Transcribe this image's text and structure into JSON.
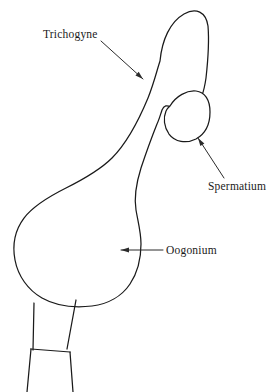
{
  "figure": {
    "type": "biological-line-diagram",
    "background_color": "#ffffff",
    "line_color": "#1a1a1a",
    "label_color": "#1a1a1a"
  },
  "labels": [
    {
      "id": "trichogyne",
      "text": "Trichogyne",
      "text_x": 43,
      "text_y": 38,
      "leader_start_x": 101,
      "leader_start_y": 41,
      "leader_end_x": 143,
      "leader_end_y": 79,
      "arrow_angle_deg": 42
    },
    {
      "id": "spermatium",
      "text": "Spermatium",
      "text_x": 208,
      "text_y": 190,
      "leader_start_x": 224,
      "leader_start_y": 178,
      "leader_end_x": 198,
      "leader_end_y": 138,
      "arrow_angle_deg": 237
    },
    {
      "id": "oogonium",
      "text": "Oogonium",
      "text_x": 166,
      "text_y": 254,
      "leader_start_x": 163,
      "leader_start_y": 250,
      "leader_end_x": 121,
      "leader_end_y": 250,
      "arrow_angle_deg": 180
    }
  ],
  "shapes": {
    "main_body": "M 160,61 C 162,40 170,22 184,14 C 196,7 206,12 208,26 C 209,38 208,60 206,78 C 204,92 201,101 196,105 C 189,110 178,110 171,107 C 167,105 164,105 162,110 C 160,116 159,120 157,124 C 153,134 147,150 141,168 C 136,184 134,198 136,210 C 138,222 141,232 141,244 C 141,258 138,272 130,284 C 122,296 108,304 92,306 C 74,308 56,306 42,298 C 28,290 18,276 15,260 C 12,244 15,230 24,218 C 34,205 50,196 66,188 C 84,179 100,170 112,158 C 126,144 138,122 148,98 C 154,83 157,70 160,61 Z",
    "spermatium_circle": "M 170,106 C 176,96 187,90 196,91 C 205,92 210,100 210,112 C 210,124 205,134 196,139 C 186,144 175,142 169,134 C 164,127 163,118 166,111 C 167,108 169,107 170,106 Z",
    "stalk_upper": "M 34,303 L 33,350 M 76,300 L 67,349",
    "stalk_septum": "M 31,349 L 70,352",
    "stalk_lower": "M 31,349 L 27,392 M 70,352 L 73,392"
  }
}
